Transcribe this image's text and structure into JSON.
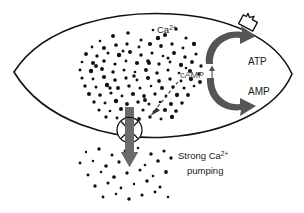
{
  "figure": {
    "background_color": "#ffffff",
    "width": 304,
    "height": 213
  },
  "labels": {
    "calcium_ion": "Ca",
    "calcium_ion_charge": "2+",
    "camp": "cAMP",
    "camp_trend_icon": "up-arrow-icon",
    "atp": "ATP",
    "amp": "AMP",
    "pumping_line1": "Strong Ca",
    "pumping_line1_charge": "2+",
    "pumping_line2": "pumping"
  },
  "elements": {
    "cell_membrane": "cell-membrane-outline",
    "receptor": "membrane-receptor-icon",
    "calcium_pump": "calcium-pump-icon",
    "pump_flux_arrow": "downward-flux-arrow-icon",
    "atp_to_amp_arrow": "atp-to-amp-arrow-icon",
    "amp_to_atp_arrow": "amp-to-atp-arrow-icon",
    "signal_arrow": "dashed-signal-arrow-icon"
  },
  "colors": {
    "outline": "#111111",
    "ion": "#111111",
    "cycle_arrow": "#555555",
    "flux_arrow": "#6b6b6b",
    "camp_text": "#4a4a4a",
    "background": "#ffffff"
  },
  "chart_data": {
    "type": "diagram",
    "inside_ion_count": 118,
    "outside_ion_count": 34,
    "annotations": [
      "Ca2+",
      "cAMP up",
      "ATP",
      "AMP",
      "Strong Ca2+ pumping"
    ]
  },
  "ions_inside": [
    [
      100,
      41
    ],
    [
      113,
      36
    ],
    [
      128,
      33
    ],
    [
      141,
      40
    ],
    [
      153,
      30
    ],
    [
      165,
      35
    ],
    [
      176,
      29
    ],
    [
      186,
      38
    ],
    [
      92,
      47
    ],
    [
      104,
      48
    ],
    [
      116,
      45
    ],
    [
      127,
      44
    ],
    [
      139,
      47
    ],
    [
      150,
      44
    ],
    [
      161,
      46
    ],
    [
      172,
      44
    ],
    [
      183,
      48
    ],
    [
      194,
      44
    ],
    [
      86,
      54
    ],
    [
      97,
      56
    ],
    [
      108,
      53
    ],
    [
      119,
      55
    ],
    [
      130,
      52
    ],
    [
      141,
      55
    ],
    [
      152,
      53
    ],
    [
      163,
      56
    ],
    [
      174,
      53
    ],
    [
      185,
      57
    ],
    [
      196,
      54
    ],
    [
      82,
      62
    ],
    [
      93,
      63
    ],
    [
      104,
      61
    ],
    [
      115,
      64
    ],
    [
      126,
      61
    ],
    [
      137,
      63
    ],
    [
      148,
      61
    ],
    [
      159,
      64
    ],
    [
      170,
      62
    ],
    [
      181,
      65
    ],
    [
      192,
      62
    ],
    [
      201,
      66
    ],
    [
      80,
      70
    ],
    [
      91,
      71
    ],
    [
      102,
      69
    ],
    [
      113,
      72
    ],
    [
      124,
      70
    ],
    [
      135,
      72
    ],
    [
      146,
      70
    ],
    [
      157,
      73
    ],
    [
      168,
      70
    ],
    [
      179,
      73
    ],
    [
      190,
      71
    ],
    [
      199,
      74
    ],
    [
      82,
      78
    ],
    [
      93,
      79
    ],
    [
      104,
      77
    ],
    [
      115,
      80
    ],
    [
      126,
      78
    ],
    [
      137,
      80
    ],
    [
      148,
      78
    ],
    [
      159,
      81
    ],
    [
      170,
      79
    ],
    [
      181,
      81
    ],
    [
      191,
      79
    ],
    [
      200,
      82
    ],
    [
      85,
      86
    ],
    [
      96,
      87
    ],
    [
      107,
      85
    ],
    [
      118,
      88
    ],
    [
      129,
      86
    ],
    [
      140,
      88
    ],
    [
      151,
      86
    ],
    [
      162,
      88
    ],
    [
      173,
      87
    ],
    [
      184,
      88
    ],
    [
      194,
      86
    ],
    [
      89,
      94
    ],
    [
      100,
      95
    ],
    [
      111,
      93
    ],
    [
      122,
      96
    ],
    [
      133,
      94
    ],
    [
      144,
      96
    ],
    [
      155,
      94
    ],
    [
      166,
      96
    ],
    [
      177,
      95
    ],
    [
      188,
      95
    ],
    [
      94,
      102
    ],
    [
      105,
      103
    ],
    [
      116,
      101
    ],
    [
      127,
      104
    ],
    [
      138,
      102
    ],
    [
      149,
      104
    ],
    [
      160,
      102
    ],
    [
      171,
      104
    ],
    [
      182,
      103
    ],
    [
      99,
      110
    ],
    [
      110,
      111
    ],
    [
      121,
      109
    ],
    [
      132,
      112
    ],
    [
      143,
      110
    ],
    [
      154,
      112
    ],
    [
      165,
      110
    ],
    [
      176,
      111
    ],
    [
      106,
      117
    ],
    [
      117,
      118
    ],
    [
      128,
      116
    ],
    [
      139,
      119
    ],
    [
      150,
      117
    ],
    [
      161,
      119
    ],
    [
      172,
      117
    ],
    [
      96,
      66
    ],
    [
      110,
      88
    ],
    [
      123,
      51
    ],
    [
      158,
      38
    ],
    [
      145,
      100
    ],
    [
      134,
      76
    ],
    [
      168,
      58
    ],
    [
      186,
      68
    ],
    [
      149,
      63
    ]
  ],
  "ions_outside": [
    [
      86,
      152
    ],
    [
      99,
      149
    ],
    [
      112,
      155
    ],
    [
      125,
      151
    ],
    [
      138,
      148
    ],
    [
      151,
      154
    ],
    [
      164,
      151
    ],
    [
      80,
      163
    ],
    [
      93,
      161
    ],
    [
      106,
      166
    ],
    [
      119,
      162
    ],
    [
      132,
      159
    ],
    [
      145,
      165
    ],
    [
      158,
      161
    ],
    [
      171,
      158
    ],
    [
      88,
      175
    ],
    [
      101,
      172
    ],
    [
      114,
      177
    ],
    [
      127,
      173
    ],
    [
      140,
      170
    ],
    [
      153,
      176
    ],
    [
      166,
      172
    ],
    [
      95,
      186
    ],
    [
      108,
      183
    ],
    [
      121,
      188
    ],
    [
      134,
      184
    ],
    [
      147,
      181
    ],
    [
      160,
      187
    ],
    [
      103,
      197
    ],
    [
      116,
      194
    ],
    [
      129,
      199
    ],
    [
      142,
      195
    ],
    [
      155,
      192
    ],
    [
      168,
      197
    ]
  ]
}
